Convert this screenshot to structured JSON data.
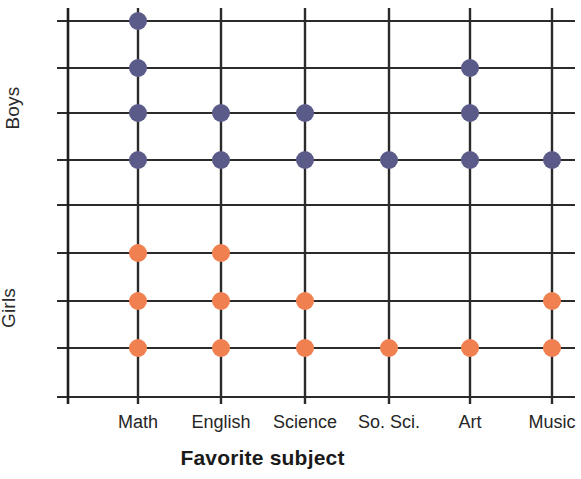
{
  "chart_data": {
    "type": "scatter",
    "title": "Favorite subject",
    "xlabel": "Favorite subject",
    "ylabel": "",
    "grid": true,
    "legend_position": "none",
    "categories": [
      "Math",
      "English",
      "Science",
      "So. Sci.",
      "Art",
      "Music"
    ],
    "groups": [
      {
        "name": "Boys",
        "color": "#5b5b8a",
        "direction": "top-down",
        "values": [
          4,
          2,
          2,
          1,
          3,
          1
        ],
        "rows_used": [
          [
            1,
            2,
            3,
            4
          ],
          [
            3,
            4
          ],
          [
            3,
            4
          ],
          [
            4
          ],
          [
            2,
            3,
            4
          ],
          [
            4
          ]
        ]
      },
      {
        "name": "Girls",
        "color": "#f0804f",
        "direction": "bottom-up",
        "values": [
          3,
          3,
          2,
          1,
          1,
          2
        ],
        "rows_used": [
          [
            6,
            7,
            8
          ],
          [
            6,
            7,
            8
          ],
          [
            7,
            8
          ],
          [
            8
          ],
          [
            8
          ],
          [
            7,
            8
          ]
        ]
      }
    ],
    "row_count": 8,
    "axis_ranges": {
      "x_ticks": [
        "Math",
        "English",
        "Science",
        "So. Sci.",
        "Art",
        "Music"
      ],
      "y_sections": [
        "Boys",
        "Girls"
      ]
    },
    "colors": {
      "boys_dot": "#5b5b8a",
      "girls_dot": "#f0804f",
      "grid_line": "#2b2b2b",
      "axis_line": "#1f1f1f",
      "background": "#ffffff"
    }
  },
  "labels": {
    "y_axis_top": "Boys",
    "y_axis_bottom": "Girls",
    "x_axis_title": "Favorite subject",
    "ticks": [
      "Math",
      "English",
      "Science",
      "So. Sci.",
      "Art",
      "Music"
    ]
  },
  "geometry": {
    "axis_x": 68,
    "axis_top": 8,
    "axis_bottom": 404,
    "grid_right": 575,
    "row_y": [
      21,
      68,
      113,
      160,
      205,
      253,
      301,
      348
    ],
    "col_x": [
      138,
      221,
      305,
      389,
      470,
      552
    ],
    "dot_radius": 9,
    "tick_label_y": 412
  }
}
